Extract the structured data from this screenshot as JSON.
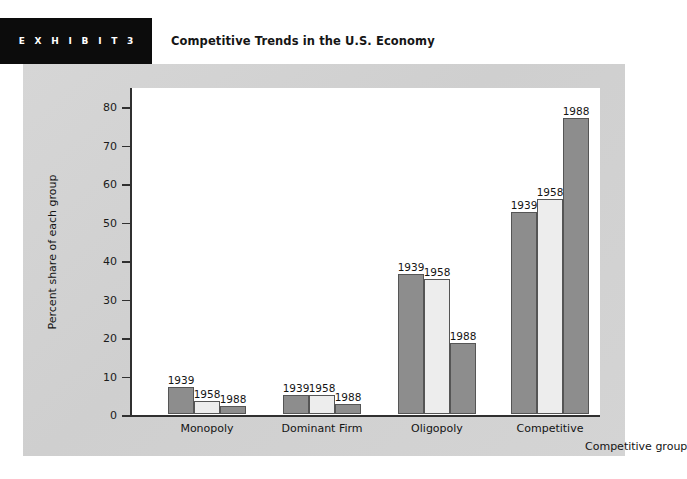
{
  "header": {
    "exhibit_banner": "E X H I B I T   3",
    "title": "Competitive Trends in the U.S. Economy"
  },
  "colors": {
    "banner_bg": "#0c0c0c",
    "card_bg": "#d3d3d3",
    "plot_bg": "#ffffff",
    "bar_dark": "#8d8d8d",
    "bar_light": "#ededed",
    "axis": "#303030"
  },
  "chart_data": {
    "type": "bar",
    "title": "Competitive Trends in the U.S. Economy",
    "xlabel": "Competitive group",
    "ylabel": "Percent share of each group",
    "ylim": [
      0,
      85
    ],
    "yticks": [
      0,
      10,
      20,
      30,
      40,
      50,
      60,
      70,
      80
    ],
    "grid": false,
    "legend": "none",
    "bar_value_labels": "series name (year) shown above each bar",
    "categories": [
      "Monopoly",
      "Dominant Firm",
      "Oligopoly",
      "Competitive"
    ],
    "series": [
      {
        "name": "1939",
        "values": [
          7,
          5,
          36.5,
          52.5
        ]
      },
      {
        "name": "1958",
        "values": [
          3.5,
          5,
          35,
          56
        ]
      },
      {
        "name": "1988",
        "values": [
          2,
          2.5,
          18.5,
          77
        ]
      }
    ]
  }
}
